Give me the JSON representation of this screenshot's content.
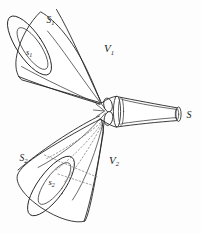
{
  "figure": {
    "background_color": "#fdfdfd",
    "line_color": "#262626",
    "hidden_line_color": "#777777"
  },
  "labels": {
    "upper_outer_surface": "S",
    "upper_outer_surface_sub": "1",
    "upper_inner_surface": "s",
    "upper_inner_surface_sub": "1",
    "upper_volume": "V",
    "upper_volume_sub": "1",
    "lower_outer_surface": "S",
    "lower_outer_surface_sub": "2",
    "lower_inner_surface": "s",
    "lower_inner_surface_sub": "2",
    "lower_volume": "V",
    "lower_volume_sub": "2",
    "tube_end_surface": "S"
  },
  "elements": {
    "upper_funnel": "upper-funnel",
    "lower_funnel": "lower-funnel",
    "central_junction": "central-junction",
    "tapered_tube": "tapered-tube",
    "tube_end_cap": "tube-end-cap",
    "hidden_guide_lines": "hidden-guide-lines"
  }
}
